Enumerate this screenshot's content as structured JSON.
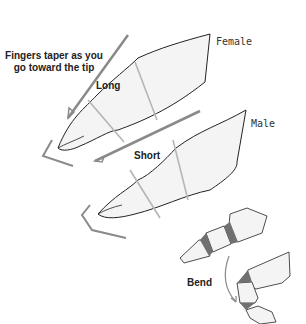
{
  "diagram": {
    "annotations": {
      "taper_note_line1": "Fingers taper as you",
      "taper_note_line2": "go toward the tip"
    },
    "fingers": [
      {
        "id": "female",
        "gender_label": "Female",
        "length_label": "Long"
      },
      {
        "id": "male",
        "gender_label": "Male",
        "length_label": "Short"
      }
    ],
    "bend": {
      "label": "Bend"
    },
    "colors": {
      "outline": "#222222",
      "fill": "#f4f4f4",
      "guide": "#b5b5b5",
      "arrow": "#8a8a8a",
      "joint_shadow": "#707070"
    }
  }
}
